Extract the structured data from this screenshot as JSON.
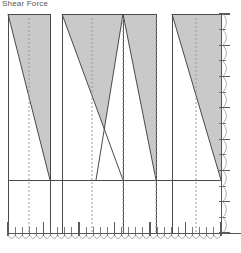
{
  "title": "Shear Force",
  "colors": {
    "fill": "#c9c9c9",
    "outline": "#4a4a4a",
    "axis": "#555555",
    "dashed": "#9a9a9a",
    "tick": "#5a5a5a",
    "arc": "#8c8c8c",
    "background": "#ffffff"
  },
  "chart_data": {
    "type": "area",
    "title": "Shear Force",
    "xlabel": "",
    "ylabel": "",
    "grid": false,
    "legend_position": "none",
    "plot": {
      "left": 8,
      "top": 14,
      "right": 221,
      "bottom": 233
    },
    "baseline_y": 180,
    "axes": {
      "bottom": {
        "y": 233,
        "x_start": 8,
        "x_end": 221,
        "major_ticks": 7,
        "minor_ticks": 28
      },
      "right": {
        "x": 221,
        "y_start": 14,
        "y_end": 233,
        "major_ticks": 6,
        "minor_ticks": 12
      }
    },
    "spans": [
      {
        "name": "span-1",
        "x0": 8,
        "x1": 50,
        "y_left": 14,
        "y_right": 180,
        "center": 29,
        "shape": "trapezoid"
      },
      {
        "name": "span-2",
        "x0": 62,
        "x1": 123,
        "y_left": 14,
        "y_right": 180,
        "center": 92,
        "shape": "trapezoid"
      },
      {
        "name": "span-3",
        "x0": 123,
        "x1": 156,
        "y_left": 14,
        "y_right": 180,
        "center": 123,
        "shape": "triangle-notch"
      },
      {
        "name": "span-4",
        "x0": 172,
        "x1": 221,
        "y_left": 14,
        "y_right": 180,
        "center": 196,
        "shape": "trapezoid"
      }
    ],
    "series": [
      {
        "name": "shear",
        "x": [
          8,
          50,
          62,
          123,
          156,
          172,
          221
        ],
        "values": [
          166,
          18,
          166,
          18,
          166,
          166,
          18
        ]
      }
    ],
    "centerlines": [
      29,
      92,
      123,
      156,
      196
    ],
    "lower_panel": {
      "top": 180,
      "bottom": 233,
      "fill": "#ffffff"
    }
  }
}
